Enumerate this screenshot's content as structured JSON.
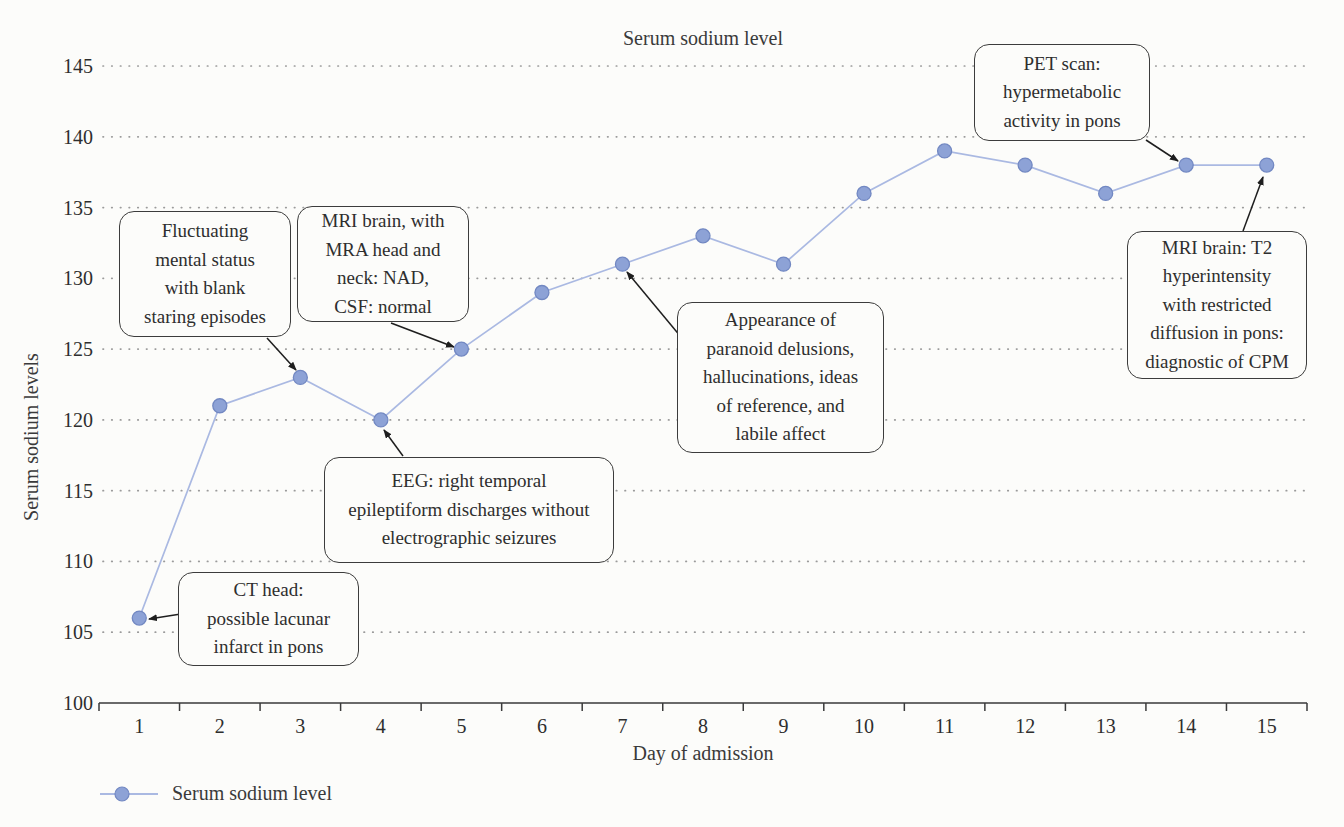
{
  "figure": {
    "title": "Serum sodium level",
    "x_axis_label": "Day of admission",
    "y_axis_label": "Serum sodium levels",
    "legend": {
      "label": "Serum sodium level"
    }
  },
  "chart_data": {
    "type": "line",
    "title": "Serum sodium level",
    "xlabel": "Day of admission",
    "ylabel": "Serum sodium levels",
    "categories": [
      "1",
      "2",
      "3",
      "4",
      "5",
      "6",
      "7",
      "8",
      "9",
      "10",
      "11",
      "12",
      "13",
      "14",
      "15"
    ],
    "series": [
      {
        "name": "Serum sodium level",
        "values": [
          106,
          121,
          123,
          120,
          125,
          129,
          131,
          133,
          131,
          136,
          139,
          138,
          136,
          138,
          138
        ]
      }
    ],
    "ylim": [
      100,
      145
    ],
    "ytick_step": 5,
    "yticks": [
      100,
      105,
      110,
      115,
      120,
      125,
      130,
      135,
      140,
      145
    ],
    "grid": "horizontal-dotted",
    "legend_position": "bottom-left",
    "line_color": "#aab9e2",
    "marker_color": "#8da2d6",
    "marker_edge_color": "#7288c2",
    "axis_color": "#3a3a3a",
    "grid_color": "#9b9b9b",
    "arrow_color": "#1e1e1e"
  },
  "annotations": [
    {
      "id": "ct-head",
      "text": "CT head:\npossible lacunar\ninfarct in pons",
      "target_day": 1,
      "target_value": 106,
      "box": {
        "left": 178,
        "top": 572,
        "width": 181,
        "height": 94
      },
      "arrow": {
        "x1": 200,
        "y1": 611,
        "x2": 149,
        "y2": 619
      }
    },
    {
      "id": "fluctuating-mental-status",
      "text": "Fluctuating\nmental status\nwith blank\nstaring episodes",
      "target_day": 3,
      "target_value": 123,
      "box": {
        "left": 119,
        "top": 211,
        "width": 172,
        "height": 126
      },
      "arrow": {
        "x1": 267,
        "y1": 338,
        "x2": 296,
        "y2": 370
      }
    },
    {
      "id": "mri-brain-mra",
      "text": "MRI brain, with\nMRA head and\nneck: NAD,\nCSF: normal",
      "target_day": 5,
      "target_value": 125,
      "box": {
        "left": 297,
        "top": 206,
        "width": 172,
        "height": 116
      },
      "arrow": {
        "x1": 391,
        "y1": 323,
        "x2": 454,
        "y2": 347
      }
    },
    {
      "id": "eeg",
      "text": "EEG: right temporal\nepileptiform discharges without\nelectrographic seizures",
      "target_day": 4,
      "target_value": 120,
      "box": {
        "left": 324,
        "top": 457,
        "width": 290,
        "height": 106
      },
      "arrow": {
        "x1": 403,
        "y1": 456,
        "x2": 384,
        "y2": 430
      }
    },
    {
      "id": "paranoid-delusions",
      "text": "Appearance of\nparanoid delusions,\nhallucinations, ideas\nof reference, and\nlabile affect",
      "target_day": 7,
      "target_value": 131,
      "box": {
        "left": 677,
        "top": 302,
        "width": 207,
        "height": 151
      },
      "arrow": {
        "x1": 681,
        "y1": 337,
        "x2": 627,
        "y2": 272
      }
    },
    {
      "id": "pet-scan",
      "text": "PET scan:\nhypermetabolic\nactivity in pons",
      "target_day": 14,
      "target_value": 138,
      "box": {
        "left": 974,
        "top": 44,
        "width": 176,
        "height": 97
      },
      "arrow": {
        "x1": 1146,
        "y1": 140,
        "x2": 1178,
        "y2": 161
      }
    },
    {
      "id": "mri-brain-t2",
      "text": "MRI brain: T2\nhyperintensity\nwith restricted\ndiffusion in pons:\ndiagnostic of CPM",
      "target_day": 15,
      "target_value": 138,
      "box": {
        "left": 1127,
        "top": 231,
        "width": 180,
        "height": 148
      },
      "arrow": {
        "x1": 1243,
        "y1": 231,
        "x2": 1263,
        "y2": 177
      }
    }
  ]
}
